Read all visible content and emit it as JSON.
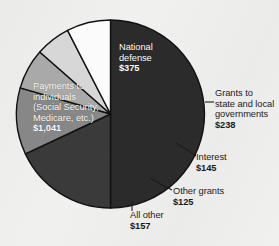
{
  "chart_data": {
    "type": "pie",
    "title": "",
    "subtitle": "",
    "xlabel": "",
    "ylabel": "",
    "units": "billions of dollars",
    "total": 2081,
    "legend_position": "none",
    "grid": false,
    "categories": [
      "Payments to individuals (Social Security, Medicare, etc.)",
      "National defense",
      "Grants to state and local governments",
      "Interest",
      "Other grants",
      "All other"
    ],
    "values": [
      1041,
      375,
      238,
      145,
      125,
      157
    ],
    "slices": [
      {
        "key": "payments-to-individuals",
        "label_lines": [
          "Payments to",
          "individuals",
          "(Social Security,",
          "Medicare, etc.)"
        ],
        "value_label": "$1,041",
        "value": 1041,
        "color": "#2b2b2b",
        "label_placement": "inside",
        "start_angle": 0,
        "sweep_angle": 180.0
      },
      {
        "key": "national-defense",
        "label_lines": [
          "National",
          "defense"
        ],
        "value_label": "$375",
        "value": 375,
        "color": "#3a3a3a",
        "label_placement": "inside",
        "start_angle": 180.0,
        "sweep_angle": 64.9
      },
      {
        "key": "grants-state-local",
        "label_lines": [
          "Grants to",
          "state and local",
          "governments"
        ],
        "value_label": "$238",
        "value": 238,
        "color": "#878787",
        "label_placement": "outside",
        "start_angle": 244.9,
        "sweep_angle": 41.2
      },
      {
        "key": "interest",
        "label_lines": [
          "Interest"
        ],
        "value_label": "$145",
        "value": 145,
        "color": "#a9a9a9",
        "label_placement": "outside",
        "start_angle": 286.1,
        "sweep_angle": 25.1
      },
      {
        "key": "other-grants",
        "label_lines": [
          "Other grants"
        ],
        "value_label": "$125",
        "value": 125,
        "color": "#d7d7d7",
        "label_placement": "outside",
        "start_angle": 311.2,
        "sweep_angle": 21.6
      },
      {
        "key": "all-other",
        "label_lines": [
          "All other"
        ],
        "value_label": "$157",
        "value": 157,
        "color": "#fbfbfb",
        "label_placement": "outside",
        "start_angle": 332.8,
        "sweep_angle": 27.2
      }
    ],
    "colors": {
      "background": "#f0f0ef",
      "outline": "#111111",
      "inside_label_text": "#ffffff",
      "outside_label_text": "#1b1b1b",
      "leader_line": "#1b1b1b"
    }
  },
  "labels": {
    "payments_to_individuals": {
      "line1": "Payments to",
      "line2": "individuals",
      "line3": "(Social Security,",
      "line4": "Medicare, etc.)",
      "amount": "$1,041"
    },
    "national_defense": {
      "line1": "National",
      "line2": "defense",
      "amount": "$375"
    },
    "grants_state_local": {
      "line1": "Grants to",
      "line2": "state and local",
      "line3": "governments",
      "amount": "$238"
    },
    "interest": {
      "line1": "Interest",
      "amount": "$145"
    },
    "other_grants": {
      "line1": "Other grants",
      "amount": "$125"
    },
    "all_other": {
      "line1": "All other",
      "amount": "$157"
    }
  }
}
